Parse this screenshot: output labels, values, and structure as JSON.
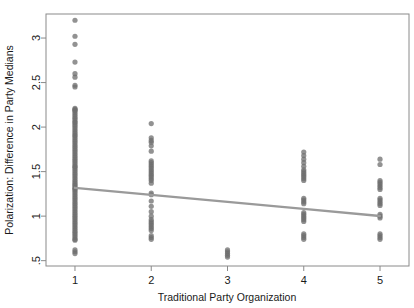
{
  "chart_data": {
    "type": "scatter",
    "title": "",
    "xlabel": "Traditional Party Organization",
    "ylabel": "Polarization: Difference in Party Medians",
    "xlim": [
      0.62,
      5.38
    ],
    "ylim": [
      0.44,
      3.27
    ],
    "xticks": [
      1,
      2,
      3,
      4,
      5
    ],
    "xticklabels": [
      "1",
      "2",
      "3",
      "4",
      "5"
    ],
    "yticks": [
      0.5,
      1,
      1.5,
      2,
      2.5,
      3
    ],
    "yticklabels": [
      ".5",
      "1",
      "1.5",
      "2",
      "2.5",
      "3"
    ],
    "grid": false,
    "legend": null,
    "point_color": "#6e6e6e",
    "point_opacity": 0.75,
    "point_radius": 2.6,
    "frame_color": "#8a8a8a",
    "fit_line": {
      "name": "linear fit",
      "color": "#9a9a9a",
      "width": 2.4,
      "x": [
        1,
        2,
        3,
        4,
        5
      ],
      "y": [
        1.318,
        1.239,
        1.16,
        1.081,
        1.002
      ]
    },
    "series": [
      {
        "name": "Traditional Party Organization = 1",
        "x_value": 1,
        "values": [
          3.2,
          3.02,
          2.93,
          2.73,
          2.6,
          2.56,
          2.47,
          2.45,
          2.21,
          2.2,
          2.19,
          2.18,
          2.16,
          2.14,
          2.12,
          2.1,
          2.08,
          2.06,
          2.05,
          2.03,
          2.01,
          1.99,
          1.97,
          1.95,
          1.93,
          1.91,
          1.9,
          1.88,
          1.86,
          1.84,
          1.82,
          1.8,
          1.78,
          1.76,
          1.74,
          1.72,
          1.7,
          1.68,
          1.66,
          1.64,
          1.62,
          1.6,
          1.58,
          1.56,
          1.55,
          1.53,
          1.51,
          1.49,
          1.47,
          1.45,
          1.43,
          1.41,
          1.39,
          1.37,
          1.35,
          1.34,
          1.32,
          1.31,
          1.3,
          1.28,
          1.26,
          1.24,
          1.22,
          1.2,
          1.18,
          1.16,
          1.14,
          1.12,
          1.1,
          1.08,
          1.06,
          1.04,
          1.02,
          1.0,
          0.98,
          0.96,
          0.94,
          0.92,
          0.9,
          0.88,
          0.86,
          0.84,
          0.82,
          0.8,
          0.78,
          0.76,
          0.74,
          0.73,
          0.62,
          0.6,
          0.58
        ]
      },
      {
        "name": "Traditional Party Organization = 2",
        "x_value": 2,
        "values": [
          2.04,
          1.88,
          1.85,
          1.83,
          1.79,
          1.73,
          1.62,
          1.6,
          1.58,
          1.56,
          1.54,
          1.52,
          1.5,
          1.48,
          1.46,
          1.44,
          1.42,
          1.4,
          1.37,
          1.26,
          1.24,
          1.17,
          1.11,
          1.05,
          1.0,
          0.96,
          0.94,
          0.92,
          0.9,
          0.88,
          0.86,
          0.84,
          0.78,
          0.76,
          0.74
        ]
      },
      {
        "name": "Traditional Party Organization = 3",
        "x_value": 3,
        "values": [
          0.62,
          0.6,
          0.58,
          0.56,
          0.54
        ]
      },
      {
        "name": "Traditional Party Organization = 4",
        "x_value": 4,
        "values": [
          1.72,
          1.68,
          1.64,
          1.6,
          1.56,
          1.52,
          1.5,
          1.48,
          1.46,
          1.44,
          1.42,
          1.4,
          1.2,
          1.18,
          1.16,
          1.14,
          1.04,
          1.02,
          1.0,
          0.98,
          0.96,
          0.94,
          0.8,
          0.78,
          0.76,
          0.74
        ]
      },
      {
        "name": "Traditional Party Organization = 5",
        "x_value": 5,
        "values": [
          1.64,
          1.58,
          1.4,
          1.38,
          1.36,
          1.34,
          1.32,
          1.3,
          1.2,
          1.18,
          1.16,
          1.14,
          1.12,
          1.02,
          1.0,
          0.98,
          0.8,
          0.78,
          0.76,
          0.74
        ]
      }
    ]
  }
}
